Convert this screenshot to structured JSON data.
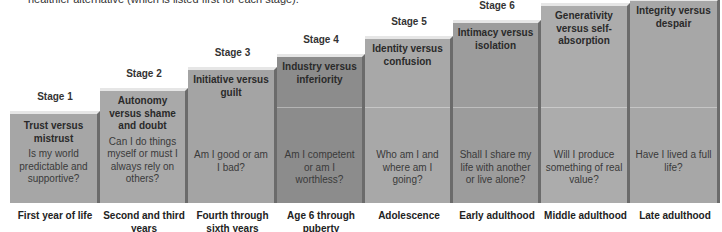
{
  "caption": "healthier alternative (which is listed first for each stage).",
  "stages": [
    {
      "label": "Stage 1",
      "title": "Trust versus mistrust",
      "question": "Is my world predictable and supportive?",
      "age": "First year of life",
      "color": "#a6a6a6"
    },
    {
      "label": "Stage 2",
      "title": "Autonomy versus shame and doubt",
      "question": "Can I do things myself or must I always rely on others?",
      "age": "Second and third years",
      "color": "#a9a9a9"
    },
    {
      "label": "Stage 3",
      "title": "Initiative versus guilt",
      "question": "Am I good or am I bad?",
      "age": "Fourth through sixth years",
      "color": "#a4a4a4"
    },
    {
      "label": "Stage 4",
      "title": "Industry versus inferiority",
      "question": "Am I competent or am I worthless?",
      "age": "Age 6 through puberty",
      "color": "#8c8c8c"
    },
    {
      "label": "Stage 5",
      "title": "Identity versus confusion",
      "question": "Who am I and where am I going?",
      "age": "Adolescence",
      "color": "#a8a8a8"
    },
    {
      "label": "Stage 6",
      "title": "Intimacy versus isolation",
      "question": "Shall I share my life with another or live alone?",
      "age": "Early adulthood",
      "color": "#9c9c9c"
    },
    {
      "label": "Stage 7",
      "title": "Generativity versus self-absorption",
      "question": "Will I produce something of real value?",
      "age": "Middle adulthood",
      "color": "#acacac"
    },
    {
      "label": "Stage 8",
      "title": "Integrity versus despair",
      "question": "Have I lived a full life?",
      "age": "Late adulthood",
      "color": "#a7a7a7"
    }
  ]
}
